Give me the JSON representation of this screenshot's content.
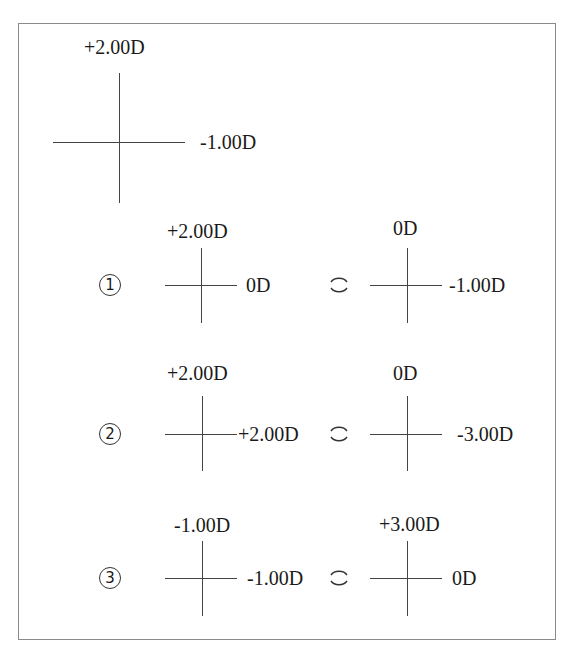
{
  "figure": {
    "main_cross": {
      "vertical_power": "+2.00D",
      "horizontal_power": "-1.00D"
    },
    "combine_symbol": "combined-with",
    "options": [
      {
        "marker": "1",
        "left": {
          "vertical_power": "+2.00D",
          "horizontal_power": "0D"
        },
        "right": {
          "vertical_power": "0D",
          "horizontal_power": "-1.00D"
        }
      },
      {
        "marker": "2",
        "left": {
          "vertical_power": "+2.00D",
          "horizontal_power": "+2.00D"
        },
        "right": {
          "vertical_power": "0D",
          "horizontal_power": "-3.00D"
        }
      },
      {
        "marker": "3",
        "left": {
          "vertical_power": "-1.00D",
          "horizontal_power": "-1.00D"
        },
        "right": {
          "vertical_power": "+3.00D",
          "horizontal_power": "0D"
        }
      }
    ]
  }
}
